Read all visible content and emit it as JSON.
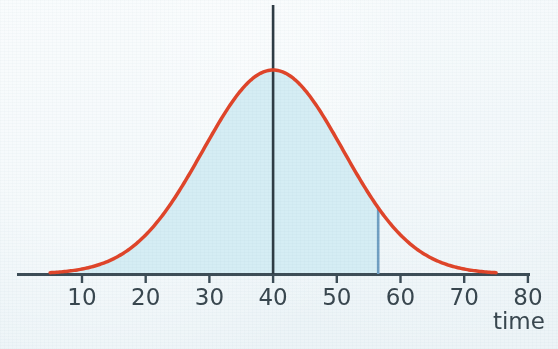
{
  "chart_data": {
    "type": "line",
    "title": "",
    "subtitle": "",
    "xlabel": "time",
    "ylabel": "",
    "grid": false,
    "legend_position": "none",
    "xlim": [
      0,
      80
    ],
    "x_ticks": [
      10,
      20,
      30,
      40,
      50,
      60,
      70,
      80
    ],
    "x_tick_labels": [
      "10",
      "20",
      "30",
      "40",
      "50",
      "60",
      "70",
      "80"
    ],
    "y_axis_visible": false,
    "curve": {
      "name": "normal distribution",
      "distribution": "normal",
      "mean": 40,
      "std_dev": 11,
      "peak_x": 40,
      "visible_x_range": [
        5,
        75
      ],
      "color": "#e0452a",
      "line_width": 3.5
    },
    "shaded_region": {
      "label": "area under curve",
      "x_from": 5,
      "x_to": 56.5,
      "fill_color": "#d5edf4"
    },
    "vertical_lines": [
      {
        "name": "mean-line",
        "x": 40,
        "color": "#2f3c45",
        "extends_above_curve": true
      },
      {
        "name": "boundary-line",
        "x": 56.5,
        "color": "#6f9fc2",
        "extends_above_curve": false
      }
    ],
    "axis_color": "#3d4d57",
    "background_color": "#eef5f8",
    "label_color": "#39474f"
  },
  "axis": {
    "x_title": "time",
    "tick_labels": [
      "10",
      "20",
      "30",
      "40",
      "50",
      "60",
      "70",
      "80"
    ]
  }
}
